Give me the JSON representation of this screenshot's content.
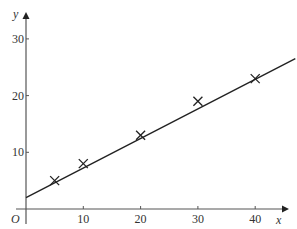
{
  "chart_data": {
    "type": "scatter",
    "title": "",
    "xlabel": "x",
    "ylabel": "y",
    "origin_label": "O",
    "xlim": [
      0,
      47
    ],
    "ylim": [
      0,
      34
    ],
    "grid": false,
    "legend": null,
    "x_ticks": [
      10,
      20,
      30,
      40
    ],
    "y_ticks": [
      10,
      20,
      30
    ],
    "x_tick_labels": [
      "10",
      "20",
      "30",
      "40"
    ],
    "y_tick_labels": [
      "10",
      "20",
      "30"
    ],
    "series": [
      {
        "name": "data points",
        "marker": "x",
        "x": [
          5,
          10,
          20,
          30,
          40
        ],
        "y": [
          5,
          8,
          13,
          19,
          23
        ]
      }
    ],
    "line_of_best_fit": {
      "x": [
        0,
        47
      ],
      "y": [
        2,
        26.5
      ]
    }
  },
  "colors": {
    "axis": "#555555",
    "line": "#222222",
    "marker": "#222222",
    "text": "#333333"
  }
}
